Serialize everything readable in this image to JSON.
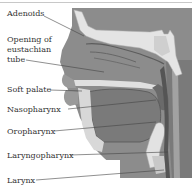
{
  "diagram": {
    "labels": [
      {
        "id": "adenoids",
        "text": "Adenoids"
      },
      {
        "id": "eustachian",
        "text": "Opening of eustachian tube"
      },
      {
        "id": "soft-palate",
        "text": "Soft palate"
      },
      {
        "id": "nasopharynx",
        "text": "Nasopharynx"
      },
      {
        "id": "oropharynx",
        "text": "Oropharynx"
      },
      {
        "id": "laryngopharynx",
        "text": "Laryngopharynx"
      },
      {
        "id": "larynx",
        "text": "Larynx"
      }
    ],
    "colors": {
      "background_tissue": "#8a8a8a",
      "dark_tissue": "#6e6e6e",
      "bone_light": "#e6e6e6",
      "cartilage": "#d2d2d2",
      "label_text": "#333333",
      "leader_line": "#444444"
    }
  }
}
